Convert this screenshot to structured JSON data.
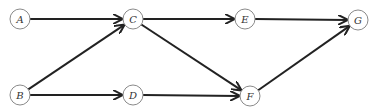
{
  "diagram": {
    "type": "directed-graph",
    "nodes": [
      {
        "id": "A",
        "label": "A",
        "x": 20,
        "y": 19
      },
      {
        "id": "C",
        "label": "C",
        "x": 133,
        "y": 19
      },
      {
        "id": "E",
        "label": "E",
        "x": 245,
        "y": 19
      },
      {
        "id": "G",
        "label": "G",
        "x": 358,
        "y": 20
      },
      {
        "id": "B",
        "label": "B",
        "x": 20,
        "y": 95
      },
      {
        "id": "D",
        "label": "D",
        "x": 133,
        "y": 95
      },
      {
        "id": "F",
        "label": "F",
        "x": 250,
        "y": 96
      }
    ],
    "edges": [
      {
        "from": "A",
        "to": "C"
      },
      {
        "from": "B",
        "to": "C"
      },
      {
        "from": "B",
        "to": "D"
      },
      {
        "from": "C",
        "to": "E"
      },
      {
        "from": "C",
        "to": "F"
      },
      {
        "from": "D",
        "to": "F"
      },
      {
        "from": "E",
        "to": "G"
      },
      {
        "from": "F",
        "to": "G"
      }
    ],
    "node_radius": 10,
    "colors": {
      "edge": "#222222",
      "node_stroke": "#8a8a8a",
      "label": "#333333",
      "background": "#ffffff"
    }
  }
}
